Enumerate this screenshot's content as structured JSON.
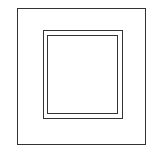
{
  "diagram": {
    "colors": {
      "background": "#ffffff",
      "stroke": "#333333"
    },
    "shapes": [
      {
        "id": "outer",
        "type": "rectangle",
        "x": 17,
        "y": 8,
        "width": 129,
        "height": 137
      },
      {
        "id": "mid",
        "type": "rectangle",
        "x": 43,
        "y": 30,
        "width": 80,
        "height": 89
      },
      {
        "id": "inner",
        "type": "rectangle",
        "x": 47,
        "y": 35,
        "width": 71,
        "height": 79
      }
    ]
  }
}
